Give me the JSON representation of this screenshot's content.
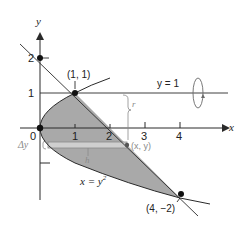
{
  "figure": {
    "axes": {
      "x_label": "x",
      "y_label": "y",
      "x_ticks": [
        "1",
        "2",
        "3",
        "4"
      ],
      "y_ticks": [
        "2",
        "1"
      ],
      "origin_label": "0"
    },
    "curves": {
      "parabola_label": "x = y",
      "parabola_exp": "2",
      "horizontal_line_label": "y = 1"
    },
    "points": {
      "p1": "(1, 1)",
      "p2": "(4, −2)",
      "strip_point": "(x, y)"
    },
    "strip": {
      "delta_label": "Δy",
      "h_label": "h",
      "r_label": "r"
    },
    "colors": {
      "shade": "#a9a9a9",
      "line": "#2a2a2a",
      "strip": "#cfcfcf",
      "annotation": "#8a8a8a"
    }
  }
}
